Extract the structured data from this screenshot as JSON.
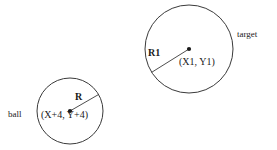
{
  "figure": {
    "background_color": "#ffffff",
    "stroke_color": "#3a3a3a",
    "text_color": "#1a1a1a"
  },
  "shapes": {
    "ball_circle": {
      "name": "ball",
      "cx": 70,
      "cy": 111,
      "r": 33
    },
    "target_circle": {
      "name": "target",
      "cx": 189,
      "cy": 49,
      "r": 44
    }
  },
  "labels": {
    "ball": "ball",
    "ball_radius": "R",
    "ball_center": "(X+4, Y+4)",
    "target_radius": "R1",
    "target_center": "(X1, Y1)",
    "target": "target"
  }
}
